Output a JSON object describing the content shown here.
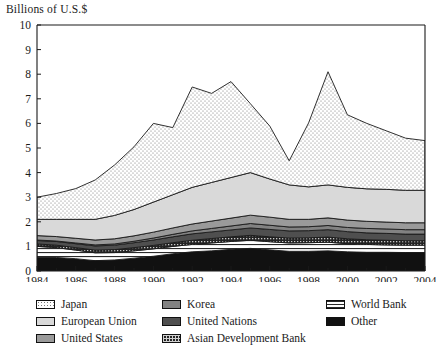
{
  "chart_title": "Billions of U.S.$",
  "axes": {
    "ylabel": "Billions of U.S.$",
    "xlabel": "",
    "ylim": [
      0,
      10
    ],
    "yticks": [
      0,
      1,
      2,
      3,
      4,
      5,
      6,
      7,
      8,
      9,
      10
    ],
    "ytick_labels": [
      "0",
      "1",
      "2",
      "3",
      "4",
      "5",
      "6",
      "7",
      "8",
      "9",
      "10"
    ],
    "xlim": [
      1984,
      2004
    ],
    "xtick_labels": [
      "1984",
      "1986",
      "1988",
      "1990",
      "1992",
      "1994",
      "1996",
      "1998",
      "2000",
      "2002",
      "2004"
    ],
    "grid": false
  },
  "legend": {
    "position": "below-plot",
    "columns": [
      {
        "entries": [
          {
            "label": "Japan",
            "swatch": "dotted-white",
            "fill": "#fdfdfd"
          },
          {
            "label": "European Union",
            "swatch": "light-gray",
            "fill": "#d9d9d9"
          },
          {
            "label": "United States",
            "swatch": "medium-gray",
            "fill": "#9a9a9a"
          }
        ]
      },
      {
        "entries": [
          {
            "label": "Korea",
            "swatch": "medium-dark-gray",
            "fill": "#828282"
          },
          {
            "label": "United Nations",
            "swatch": "dark-gray",
            "fill": "#4f4f4f"
          },
          {
            "label": "Asian Development Bank",
            "swatch": "checkered-dark",
            "fill": "#2b2b2b"
          }
        ]
      },
      {
        "entries": [
          {
            "label": "World Bank",
            "swatch": "horizontal-lines",
            "fill": "#ffffff"
          },
          {
            "label": "Other",
            "swatch": "solid-black",
            "fill": "#111111"
          }
        ]
      }
    ]
  },
  "chart_data": {
    "type": "area",
    "title": "Billions of U.S.$",
    "subtitle": "",
    "xlabel": "",
    "ylabel": "Billions of U.S.$",
    "ylim": [
      0,
      10
    ],
    "xlim": [
      1984,
      2004
    ],
    "stacked": true,
    "stack_order_bottom_to_top": [
      "Other",
      "World Bank",
      "Asian Development Bank",
      "United Nations",
      "Korea",
      "United States",
      "European Union",
      "Japan"
    ],
    "x": [
      1984,
      1985,
      1986,
      1987,
      1988,
      1989,
      1990,
      1991,
      1992,
      1993,
      1994,
      1995,
      1996,
      1997,
      1998,
      1999,
      2000,
      2001,
      2002,
      2003,
      2004
    ],
    "series": [
      {
        "name": "Other",
        "fill": "#111111",
        "values": [
          0.55,
          0.55,
          0.5,
          0.42,
          0.45,
          0.52,
          0.6,
          0.7,
          0.78,
          0.82,
          0.88,
          0.92,
          0.86,
          0.8,
          0.8,
          0.82,
          0.78,
          0.76,
          0.76,
          0.75,
          0.75
        ]
      },
      {
        "name": "World Bank",
        "fill": "#ffffff",
        "pattern": "horizontal-lines",
        "values": [
          0.45,
          0.4,
          0.35,
          0.32,
          0.3,
          0.3,
          0.3,
          0.3,
          0.3,
          0.32,
          0.32,
          0.33,
          0.33,
          0.34,
          0.35,
          0.35,
          0.33,
          0.32,
          0.3,
          0.3,
          0.3
        ]
      },
      {
        "name": "Asian Development Bank",
        "fill": "#2b2b2b",
        "pattern": "checkered",
        "values": [
          0.1,
          0.1,
          0.1,
          0.11,
          0.12,
          0.13,
          0.14,
          0.15,
          0.17,
          0.18,
          0.19,
          0.2,
          0.2,
          0.2,
          0.2,
          0.21,
          0.2,
          0.19,
          0.19,
          0.18,
          0.18
        ]
      },
      {
        "name": "United Nations",
        "fill": "#4f4f4f",
        "values": [
          0.14,
          0.15,
          0.16,
          0.17,
          0.18,
          0.2,
          0.22,
          0.24,
          0.26,
          0.27,
          0.28,
          0.3,
          0.3,
          0.29,
          0.29,
          0.3,
          0.29,
          0.28,
          0.28,
          0.27,
          0.27
        ]
      },
      {
        "name": "Korea",
        "fill": "#828282",
        "values": [
          0.02,
          0.02,
          0.03,
          0.04,
          0.05,
          0.06,
          0.08,
          0.1,
          0.12,
          0.14,
          0.16,
          0.18,
          0.17,
          0.16,
          0.16,
          0.17,
          0.17,
          0.18,
          0.18,
          0.18,
          0.18
        ]
      },
      {
        "name": "United States",
        "fill": "#9a9a9a",
        "values": [
          0.18,
          0.18,
          0.19,
          0.2,
          0.21,
          0.22,
          0.24,
          0.26,
          0.28,
          0.3,
          0.32,
          0.34,
          0.33,
          0.31,
          0.3,
          0.31,
          0.3,
          0.29,
          0.28,
          0.28,
          0.28
        ]
      },
      {
        "name": "European Union",
        "fill": "#d9d9d9",
        "values": [
          0.66,
          0.7,
          0.77,
          0.84,
          0.95,
          1.07,
          1.22,
          1.35,
          1.49,
          1.57,
          1.65,
          1.73,
          1.55,
          1.4,
          1.32,
          1.34,
          1.33,
          1.32,
          1.33,
          1.32,
          1.32
        ]
      },
      {
        "name": "Japan",
        "fill": "#fdfdfd",
        "pattern": "dotted",
        "values": [
          0.9,
          1.05,
          1.25,
          1.6,
          2.05,
          2.55,
          3.2,
          2.73,
          4.08,
          3.62,
          3.9,
          2.8,
          2.15,
          0.98,
          2.6,
          4.6,
          2.95,
          2.66,
          2.38,
          2.12,
          2.02
        ]
      }
    ],
    "totals": [
      3.0,
      3.15,
      3.35,
      3.7,
      4.31,
      5.05,
      6.0,
      5.83,
      7.48,
      7.22,
      7.7,
      6.8,
      5.89,
      4.48,
      6.02,
      8.1,
      6.35,
      6.0,
      5.7,
      5.4,
      5.3
    ],
    "annotations": []
  }
}
